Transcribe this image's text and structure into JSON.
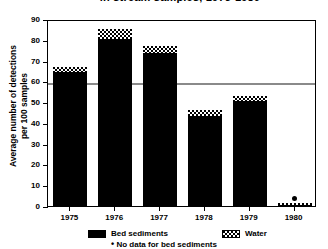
{
  "chart_data": {
    "type": "bar",
    "title": "in stream samples, 1975-1980",
    "xlabel": "",
    "ylabel": "Average number of detections per 100 samples",
    "ylim": [
      0,
      90
    ],
    "yticks": [
      0,
      10,
      20,
      30,
      40,
      50,
      60,
      70,
      80,
      90
    ],
    "grid": false,
    "legend_position": "bottom",
    "categories": [
      "1975",
      "1976",
      "1977",
      "1978",
      "1979",
      "1980"
    ],
    "series": [
      {
        "name": "Bed sediments",
        "values": [
          64,
          80,
          73,
          43,
          50,
          null
        ]
      },
      {
        "name": "Water",
        "values": [
          3,
          5,
          4,
          3,
          3,
          1.5
        ]
      }
    ],
    "totals": [
      67,
      85,
      77,
      46,
      53,
      1.5
    ],
    "reference_line": {
      "value": 60,
      "color": "#8a8a8a"
    },
    "annotations": [
      {
        "category": "1980",
        "marker": "dot",
        "note": "No data for bed sediments"
      }
    ]
  },
  "axis": {
    "y_title_line1": "Average number of detections",
    "y_title_line2": "per 100 samples",
    "tick_labels": [
      "90",
      "80",
      "70",
      "60",
      "50",
      "40",
      "30",
      "20",
      "10",
      "0"
    ]
  },
  "legend": {
    "bed_sediments_label": "Bed sediments",
    "water_label": "Water",
    "footnote_marker": "•",
    "footnote_text": "No data for bed sediments"
  }
}
